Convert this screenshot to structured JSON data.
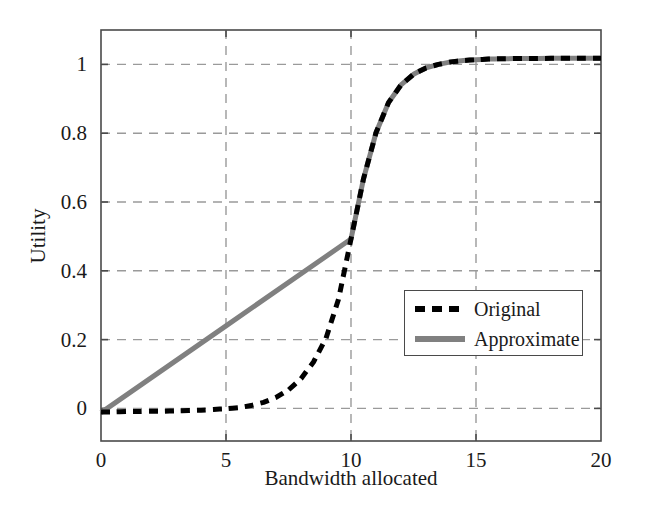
{
  "chart_data": {
    "type": "line",
    "title": "",
    "xlabel": "Bandwidth allocated",
    "ylabel": "Utility",
    "xlim": [
      0,
      20
    ],
    "ylim": [
      -0.08,
      1.08
    ],
    "xticks": [
      "0",
      "5",
      "10",
      "15",
      "20"
    ],
    "xtick_values": [
      0,
      5,
      10,
      15,
      20
    ],
    "yticks": [
      "0",
      "0.2",
      "0.4",
      "0.6",
      "0.8",
      "1"
    ],
    "ytick_values": [
      0,
      0.2,
      0.4,
      0.6,
      0.8,
      1
    ],
    "grid": true,
    "grid_style": "dashed",
    "grid_color": "#999999",
    "legend_position": "center-right",
    "series": [
      {
        "name": "Original",
        "style": "dashed",
        "color": "#000000",
        "width": 5,
        "x": [
          0,
          0.5,
          1,
          1.5,
          2,
          2.5,
          3,
          3.5,
          4,
          4.5,
          5,
          5.5,
          6,
          6.5,
          7,
          7.5,
          8,
          8.5,
          9,
          9.5,
          10,
          10.5,
          11,
          11.5,
          12,
          12.5,
          13,
          13.5,
          14,
          14.5,
          15,
          15.5,
          16,
          17,
          18,
          19,
          20
        ],
        "y": [
          0.002,
          0.002,
          0.003,
          0.003,
          0.004,
          0.004,
          0.005,
          0.006,
          0.007,
          0.009,
          0.011,
          0.014,
          0.02,
          0.029,
          0.043,
          0.064,
          0.096,
          0.143,
          0.21,
          0.32,
          0.49,
          0.66,
          0.79,
          0.875,
          0.925,
          0.955,
          0.973,
          0.983,
          0.99,
          0.994,
          0.996,
          0.998,
          0.999,
          0.9995,
          1.0,
          1.0,
          1.0
        ]
      },
      {
        "name": "Approximate",
        "style": "solid",
        "color": "#808080",
        "width": 5,
        "x": [
          0,
          10,
          10.5,
          11,
          11.5,
          12,
          12.5,
          13,
          13.5,
          14,
          14.5,
          15,
          15.5,
          16,
          17,
          18,
          19,
          20
        ],
        "y": [
          0.0,
          0.49,
          0.66,
          0.79,
          0.875,
          0.925,
          0.955,
          0.973,
          0.983,
          0.99,
          0.994,
          0.996,
          0.998,
          0.999,
          0.9995,
          1.0,
          1.0,
          1.0
        ]
      }
    ],
    "legend": [
      {
        "label": "Original",
        "style": "dashed",
        "color": "#000000"
      },
      {
        "label": "Approximate",
        "style": "solid",
        "color": "#808080"
      }
    ]
  }
}
